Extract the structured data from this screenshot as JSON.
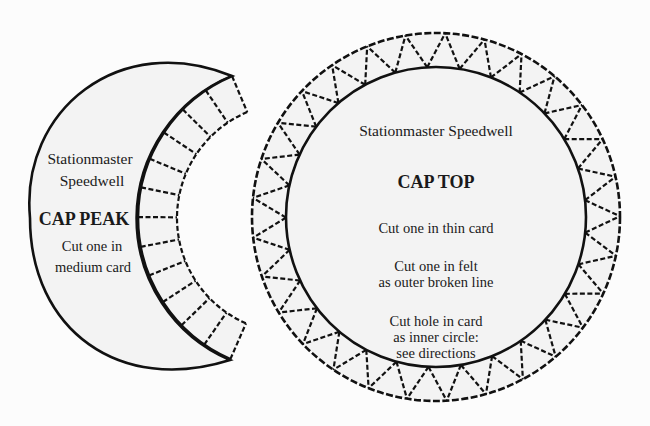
{
  "colors": {
    "background": "#fcfcfc",
    "shape_fill": "#f3f3f3",
    "line": "#111111"
  },
  "cap_peak": {
    "owner_line1": "Stationmaster",
    "owner_line2": "Speedwell",
    "title": "CAP PEAK",
    "instruction_line1": "Cut one in",
    "instruction_line2": "medium card",
    "tab_segments": 12
  },
  "cap_top": {
    "owner": "Stationmaster Speedwell",
    "title": "CAP TOP",
    "instruction1": "Cut  one in thin card",
    "instruction2_line1": "Cut one in felt",
    "instruction2_line2": "as outer broken line",
    "instruction3_line1": "Cut hole in card",
    "instruction3_line2": "as inner circle:",
    "instruction3_line3": "see directions",
    "tab_count": 29
  }
}
